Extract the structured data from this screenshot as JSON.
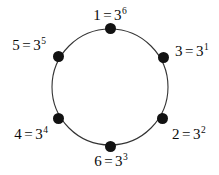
{
  "figure": {
    "background_color": "#ffffff",
    "stroke_color": "#333333",
    "node_color": "#121212",
    "text_color": "#0a0a0a",
    "circle": {
      "cx": 110,
      "cy": 87,
      "r": 58
    }
  },
  "nodes": [
    {
      "id": "node-top",
      "name": "1 = 3^6",
      "base_text": "1",
      "equals": "=",
      "power_base": "3",
      "exponent": "6",
      "x": 110,
      "y": 28,
      "label_x": 110,
      "label_y": 8,
      "label_align": "center"
    },
    {
      "id": "node-upper-right",
      "name": "3 = 3^1",
      "base_text": "3",
      "equals": "=",
      "power_base": "3",
      "exponent": "1",
      "x": 163,
      "y": 57,
      "label_x": 175,
      "label_y": 44,
      "label_align": "left"
    },
    {
      "id": "node-lower-right",
      "name": "2 = 3^2",
      "base_text": "2",
      "equals": "=",
      "power_base": "3",
      "exponent": "2",
      "x": 162,
      "y": 118,
      "label_x": 172,
      "label_y": 127,
      "label_align": "left"
    },
    {
      "id": "node-bottom",
      "name": "6 = 3^3",
      "base_text": "6",
      "equals": "=",
      "power_base": "3",
      "exponent": "3",
      "x": 110,
      "y": 146,
      "label_x": 111,
      "label_y": 154,
      "label_align": "center"
    },
    {
      "id": "node-lower-left",
      "name": "4 = 3^4",
      "base_text": "4",
      "equals": "=",
      "power_base": "3",
      "exponent": "4",
      "x": 58,
      "y": 118,
      "label_x": 48,
      "label_y": 127,
      "label_align": "right"
    },
    {
      "id": "node-upper-left",
      "name": "5 = 3^5",
      "base_text": "5",
      "equals": "=",
      "power_base": "3",
      "exponent": "5",
      "x": 58,
      "y": 56,
      "label_x": 46,
      "label_y": 38,
      "label_align": "right"
    }
  ]
}
